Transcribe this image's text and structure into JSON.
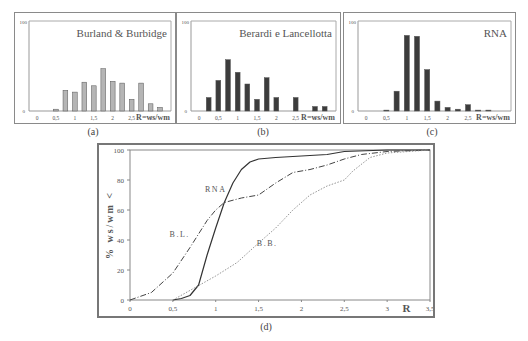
{
  "chart_data": [
    {
      "id": "a",
      "type": "bar",
      "caption": "(a)",
      "title": "Burland & Burbidge",
      "xlabel": "R=ws/wm",
      "ylabel": "",
      "ylim": [
        0,
        100
      ],
      "yticks": [
        "0",
        "100"
      ],
      "xticks": [
        "0",
        "0,5",
        "1",
        "1,5",
        "2",
        "2,5",
        "3"
      ],
      "xlim": [
        0,
        3.75
      ],
      "bar_color": "#b5b5b5",
      "x": [
        0.5,
        0.75,
        1.0,
        1.25,
        1.5,
        1.75,
        2.0,
        2.25,
        2.5,
        2.75,
        3.0,
        3.25
      ],
      "values": [
        2,
        23,
        21,
        32,
        28,
        47,
        33,
        31,
        13,
        31,
        8,
        4
      ],
      "grid": false
    },
    {
      "id": "b",
      "type": "bar",
      "caption": "(b)",
      "title": "Berardi e Lancellotta",
      "xlabel": "R=ws/wm",
      "ylabel": "",
      "ylim": [
        0,
        100
      ],
      "yticks": [
        "0",
        "100"
      ],
      "xticks": [
        "0",
        "0,5",
        "1",
        "1,5",
        "2",
        "2,5",
        "3"
      ],
      "xlim": [
        0,
        3.75
      ],
      "bar_color": "#3c3c3c",
      "x": [
        0.25,
        0.5,
        0.75,
        1.0,
        1.25,
        1.5,
        1.75,
        2.0,
        2.5,
        3.0,
        3.25
      ],
      "values": [
        15,
        34,
        57,
        43,
        30,
        13,
        37,
        15,
        15,
        5,
        5
      ],
      "grid": false
    },
    {
      "id": "c",
      "type": "bar",
      "caption": "(c)",
      "title": "RNA",
      "xlabel": "R=ws/wm",
      "ylabel": "",
      "ylim": [
        0,
        100
      ],
      "yticks": [
        "0",
        "100"
      ],
      "xticks": [
        "0",
        "0,5",
        "1",
        "1,5",
        "2",
        "2,5"
      ],
      "xlim": [
        0,
        3.75
      ],
      "bar_color": "#3c3c3c",
      "x": [
        0.5,
        0.75,
        1.0,
        1.25,
        1.5,
        1.75,
        2.0,
        2.25,
        2.5,
        2.75,
        3.0
      ],
      "values": [
        1,
        22,
        84,
        83,
        46,
        11,
        4,
        2,
        7,
        1,
        1
      ],
      "grid": false
    },
    {
      "id": "d",
      "type": "line",
      "caption": "(d)",
      "title": "",
      "xlabel": "R",
      "ylabel": "% ws/wm <",
      "xlim": [
        0,
        3.5
      ],
      "ylim": [
        0,
        100
      ],
      "xticks": [
        "0",
        "0,5",
        "1",
        "1,5",
        "2",
        "2,5",
        "3",
        "3,5"
      ],
      "yticks": [
        "0",
        "20",
        "40",
        "60",
        "80",
        "100"
      ],
      "grid": false,
      "series": [
        {
          "name": "RNA",
          "style": "solid",
          "label_pos": [
            1.0,
            72
          ],
          "points": [
            [
              0.5,
              0
            ],
            [
              0.6,
              1
            ],
            [
              0.7,
              3
            ],
            [
              0.8,
              10
            ],
            [
              0.9,
              30
            ],
            [
              1.0,
              48
            ],
            [
              1.1,
              65
            ],
            [
              1.2,
              78
            ],
            [
              1.3,
              87
            ],
            [
              1.4,
              92
            ],
            [
              1.5,
              94
            ],
            [
              1.7,
              95
            ],
            [
              2.0,
              96
            ],
            [
              2.3,
              97
            ],
            [
              2.5,
              99
            ],
            [
              3.0,
              100
            ],
            [
              3.5,
              100
            ]
          ]
        },
        {
          "name": "B.L.",
          "style": "dashdot",
          "label_pos": [
            0.58,
            42
          ],
          "points": [
            [
              0,
              0
            ],
            [
              0.25,
              5
            ],
            [
              0.5,
              18
            ],
            [
              0.7,
              35
            ],
            [
              0.9,
              53
            ],
            [
              1.0,
              60
            ],
            [
              1.1,
              65
            ],
            [
              1.3,
              68
            ],
            [
              1.5,
              70
            ],
            [
              1.7,
              78
            ],
            [
              1.9,
              85
            ],
            [
              2.1,
              87
            ],
            [
              2.3,
              90
            ],
            [
              2.5,
              94
            ],
            [
              2.7,
              97
            ],
            [
              3.0,
              99
            ],
            [
              3.5,
              100
            ]
          ]
        },
        {
          "name": "B.B.",
          "style": "dotted",
          "label_pos": [
            1.6,
            36
          ],
          "points": [
            [
              0.5,
              0
            ],
            [
              0.75,
              8
            ],
            [
              1.0,
              16
            ],
            [
              1.25,
              25
            ],
            [
              1.5,
              38
            ],
            [
              1.7,
              48
            ],
            [
              1.9,
              60
            ],
            [
              2.1,
              70
            ],
            [
              2.3,
              76
            ],
            [
              2.5,
              80
            ],
            [
              2.6,
              86
            ],
            [
              2.8,
              95
            ],
            [
              3.0,
              98
            ],
            [
              3.5,
              100
            ]
          ]
        }
      ]
    }
  ]
}
